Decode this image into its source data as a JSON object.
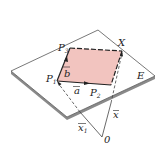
{
  "diagram": {
    "type": "vector-plane-parametric",
    "colors": {
      "plane_fill": "#ffffff",
      "plane_edge": "#555555",
      "plane_thickness": "#8a8a8a",
      "parallelogram_fill": "#f2c4bf",
      "line": "#222222"
    },
    "labels": {
      "p1": "P",
      "p1_sub": "1",
      "p2": "P",
      "p2_sub": "2",
      "p3": "P",
      "p3_sub": "3",
      "x_point": "X",
      "plane": "E",
      "vec_a": "a",
      "vec_b": "b",
      "vec_x": "x",
      "vec_x1": "x",
      "vec_x1_sub": "1",
      "origin": "0"
    }
  }
}
